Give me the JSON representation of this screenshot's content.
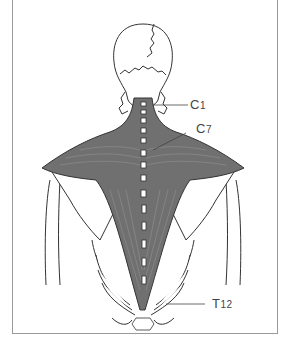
{
  "diagram": {
    "type": "anatomical-illustration",
    "colors": {
      "muscle": "#707070",
      "muscle_light": "#8c8c8c",
      "bone_fill": "#ffffff",
      "outline": "#333333",
      "frame": "#9a9a9a",
      "label": "#444444"
    },
    "labels": [
      {
        "id": "c1",
        "text": "C",
        "sub": "1"
      },
      {
        "id": "c7",
        "text": "C",
        "sub": "7"
      },
      {
        "id": "t12",
        "text": "T",
        "sub": "12"
      }
    ]
  }
}
